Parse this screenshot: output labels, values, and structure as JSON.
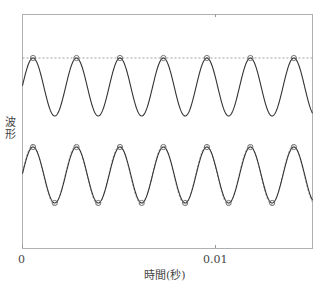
{
  "chart_data": {
    "type": "line",
    "title": "",
    "xlabel": "時間(秒)",
    "ylabel": "波形",
    "xlim": [
      0,
      0.015
    ],
    "x_ticks": [
      {
        "value": 0,
        "label": "0"
      },
      {
        "value": 0.01,
        "label": "0.01"
      }
    ],
    "y_ticks": [],
    "grid": false,
    "legend": null,
    "series": [
      {
        "name": "upper-waveform",
        "style": "solid",
        "frequency_hz": 444,
        "amplitude": 1,
        "offset": 1.0,
        "phase_start": "rising-from-center",
        "peak_markers": true,
        "peak_times": [
          0.0006,
          0.0029,
          0.0051,
          0.0074,
          0.0096,
          0.0118,
          0.0141
        ]
      },
      {
        "name": "upper-peak-reference",
        "style": "dashed",
        "constant_at": "upper-peak-level"
      },
      {
        "name": "lower-waveform",
        "style": "solid",
        "frequency_hz": 444,
        "amplitude": 1,
        "offset": -1.0,
        "peak_markers": true,
        "trough_markers": true
      },
      {
        "name": "lower-reference-sine",
        "style": "dashed",
        "frequency_hz": 444,
        "amplitude": 1,
        "offset": -1.0
      }
    ]
  },
  "axes": {
    "xlabel": "時間(秒)",
    "ylabel": "波形",
    "tick0": "0",
    "tick1": "0.01"
  }
}
